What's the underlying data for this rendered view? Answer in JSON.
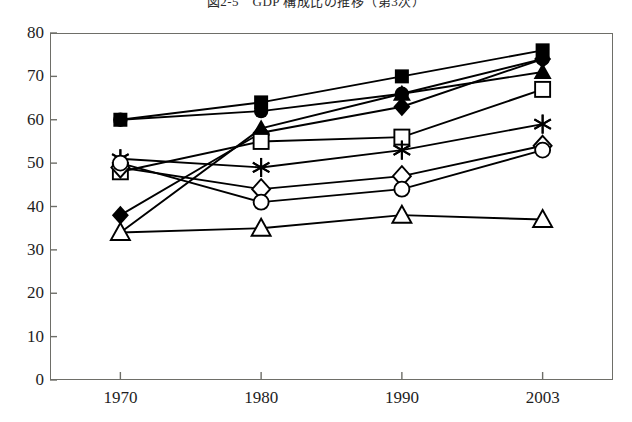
{
  "figure": {
    "title": "図2-5　GDP 構成比の推移（第3次）",
    "title_visible_note": "cropped at top edge",
    "background_color": "#ffffff",
    "ink_color": "#000000",
    "frame_color": "#6e6e68"
  },
  "chart_data": {
    "type": "line",
    "title": "図2-5　GDP 構成比の推移（第3次）",
    "xlabel": "",
    "ylabel": "",
    "categories": [
      "1970",
      "1980",
      "1990",
      "2003"
    ],
    "x": [
      1970,
      1980,
      1990,
      2003
    ],
    "ylim": [
      0,
      80
    ],
    "yticks": [
      0,
      10,
      20,
      30,
      40,
      50,
      60,
      70,
      80
    ],
    "grid": false,
    "legend": "none",
    "series": [
      {
        "name": "filled-square",
        "marker": "filled-square",
        "values": [
          60,
          64,
          70,
          76
        ]
      },
      {
        "name": "filled-circle",
        "marker": "filled-circle",
        "values": [
          60,
          62,
          66,
          74
        ]
      },
      {
        "name": "filled-diamond",
        "marker": "filled-diamond",
        "values": [
          38,
          57,
          63,
          74
        ]
      },
      {
        "name": "filled-triangle",
        "marker": "filled-triangle",
        "values": [
          34,
          58,
          66,
          71
        ]
      },
      {
        "name": "open-square",
        "marker": "open-square",
        "values": [
          48,
          55,
          56,
          67
        ]
      },
      {
        "name": "asterisk",
        "marker": "asterisk",
        "values": [
          51,
          49,
          53,
          59
        ]
      },
      {
        "name": "open-diamond",
        "marker": "open-diamond",
        "values": [
          49,
          44,
          47,
          54
        ]
      },
      {
        "name": "open-circle",
        "marker": "open-circle",
        "values": [
          50,
          41,
          44,
          53
        ]
      },
      {
        "name": "open-triangle",
        "marker": "open-triangle",
        "values": [
          34,
          35,
          38,
          37
        ]
      }
    ]
  },
  "axes": {
    "y_ticks": [
      "80",
      "70",
      "60",
      "50",
      "40",
      "30",
      "20",
      "10",
      "0"
    ],
    "x_ticks": [
      "1970",
      "1980",
      "1990",
      "2003"
    ]
  }
}
